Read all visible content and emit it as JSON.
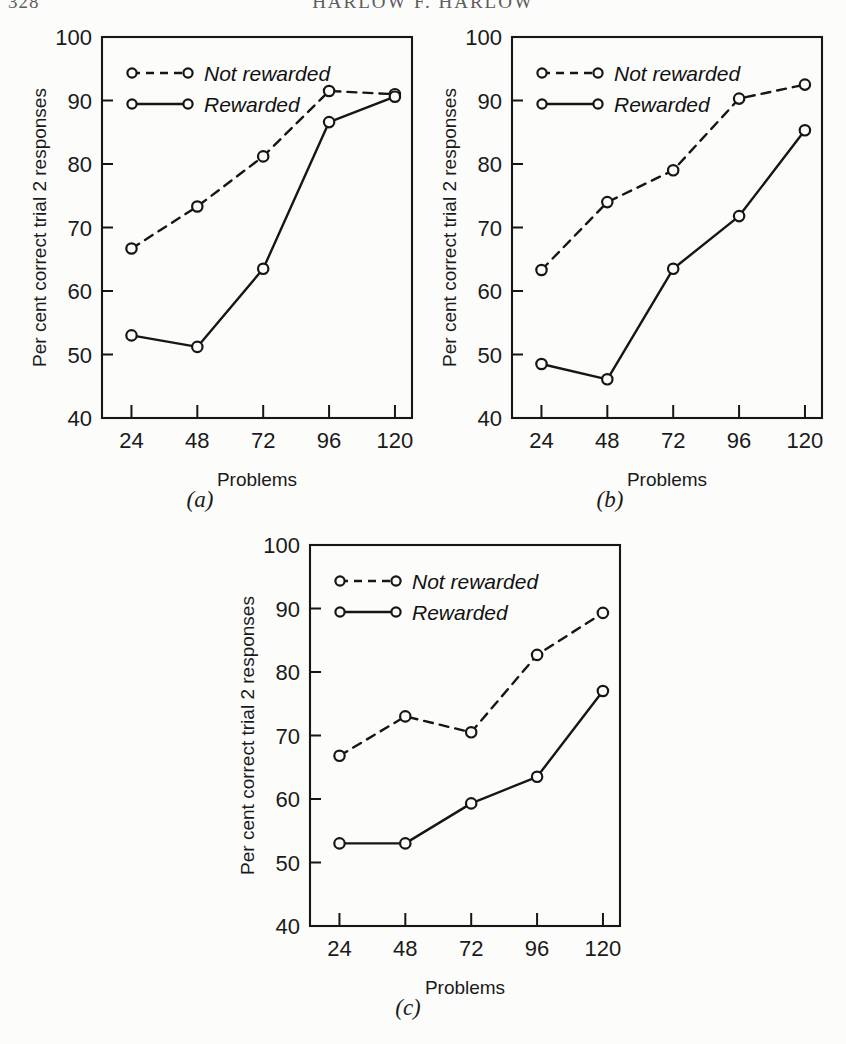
{
  "running_head": {
    "folio": "328",
    "title": "HARLOW F. HARLOW"
  },
  "figure": {
    "panels": [
      {
        "caption": "(a)",
        "xlabel": "Problems",
        "ylabel": "Per cent correct trial 2 responses"
      },
      {
        "caption": "(b)",
        "xlabel": "Problems",
        "ylabel": "Per cent correct trial 2 responses"
      },
      {
        "caption": "(c)",
        "xlabel": "Problems",
        "ylabel": "Per cent correct trial 2 responses"
      }
    ],
    "legend": {
      "not_rewarded": "Not rewarded",
      "rewarded": "Rewarded"
    },
    "colors": {
      "ink": "#161616",
      "paper": "#fcfcfb"
    }
  },
  "chart_data": [
    {
      "type": "line",
      "panel": "(a)",
      "title": "",
      "xlabel": "Problems",
      "ylabel": "Per cent correct trial 2 responses",
      "categories": [
        "24",
        "48",
        "72",
        "96",
        "120"
      ],
      "x": [
        24,
        48,
        72,
        96,
        120
      ],
      "ylim": [
        40,
        100
      ],
      "yticks": [
        40,
        50,
        60,
        70,
        80,
        90,
        100
      ],
      "ytick_labels": [
        "40",
        "50",
        "60",
        "70",
        "80",
        "90",
        "100"
      ],
      "grid": false,
      "legend_position": "top-left",
      "series": [
        {
          "name": "Not rewarded",
          "style": "dashed",
          "marker": "open-circle",
          "values": [
            66.7,
            73.3,
            81.2,
            91.5,
            91.0
          ]
        },
        {
          "name": "Rewarded",
          "style": "solid",
          "marker": "open-circle",
          "values": [
            53.0,
            51.2,
            63.5,
            86.6,
            90.6
          ]
        }
      ]
    },
    {
      "type": "line",
      "panel": "(b)",
      "title": "",
      "xlabel": "Problems",
      "ylabel": "Per cent correct trial 2 responses",
      "categories": [
        "24",
        "48",
        "72",
        "96",
        "120"
      ],
      "x": [
        24,
        48,
        72,
        96,
        120
      ],
      "ylim": [
        40,
        100
      ],
      "yticks": [
        40,
        50,
        60,
        70,
        80,
        90,
        100
      ],
      "ytick_labels": [
        "40",
        "50",
        "60",
        "70",
        "80",
        "90",
        "100"
      ],
      "grid": false,
      "legend_position": "top-left",
      "series": [
        {
          "name": "Not rewarded",
          "style": "dashed",
          "marker": "open-circle",
          "values": [
            63.3,
            74.0,
            79.0,
            90.3,
            92.5
          ]
        },
        {
          "name": "Rewarded",
          "style": "solid",
          "marker": "open-circle",
          "values": [
            48.5,
            46.1,
            63.5,
            71.8,
            85.3
          ]
        }
      ]
    },
    {
      "type": "line",
      "panel": "(c)",
      "title": "",
      "xlabel": "Problems",
      "ylabel": "Per cent correct trial 2 responses",
      "categories": [
        "24",
        "48",
        "72",
        "96",
        "120"
      ],
      "x": [
        24,
        48,
        72,
        96,
        120
      ],
      "ylim": [
        40,
        100
      ],
      "yticks": [
        40,
        50,
        60,
        70,
        80,
        90,
        100
      ],
      "ytick_labels": [
        "40",
        "50",
        "60",
        "70",
        "80",
        "90",
        "100"
      ],
      "grid": false,
      "legend_position": "top-left",
      "series": [
        {
          "name": "Not rewarded",
          "style": "dashed",
          "marker": "open-circle",
          "values": [
            66.8,
            73.0,
            70.5,
            82.7,
            89.3
          ]
        },
        {
          "name": "Rewarded",
          "style": "solid",
          "marker": "open-circle",
          "values": [
            53.0,
            53.0,
            59.3,
            63.5,
            77.0
          ]
        }
      ]
    }
  ]
}
